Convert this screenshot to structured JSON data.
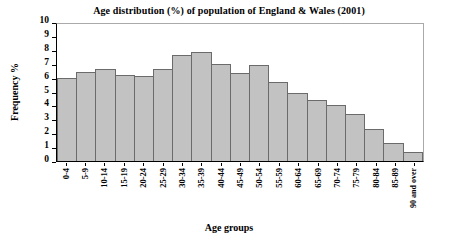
{
  "chart_data": {
    "type": "bar",
    "title": "Age distribution (%) of population of England & Wales (2001)",
    "xlabel": "Age groups",
    "ylabel": "Frequency %",
    "categories": [
      "0-4",
      "5-9",
      "10-14",
      "15-19",
      "20-24",
      "25-29",
      "30-34",
      "35-39",
      "40-44",
      "45-49",
      "50-54",
      "55-59",
      "60-64",
      "65-69",
      "70-74",
      "75-79",
      "80-84",
      "85-89",
      "90 and over"
    ],
    "values": [
      6.0,
      6.4,
      6.6,
      6.2,
      6.1,
      6.6,
      7.6,
      7.85,
      7.0,
      6.35,
      6.9,
      5.7,
      4.9,
      4.4,
      4.0,
      3.35,
      2.3,
      1.3,
      0.65
    ],
    "ylim": [
      0,
      10
    ],
    "ytick_step": 1,
    "yticks": [
      "0",
      "1",
      "2",
      "3",
      "4",
      "5",
      "6",
      "7",
      "8",
      "9",
      "10"
    ],
    "grid": false,
    "legend": null,
    "bar_fill_color": "#c2c2c2",
    "bar_border_color": "#6b6b6b",
    "axis_color": "#000000",
    "frame_color": "#aaaaaa",
    "background_color": "#ffffff"
  }
}
